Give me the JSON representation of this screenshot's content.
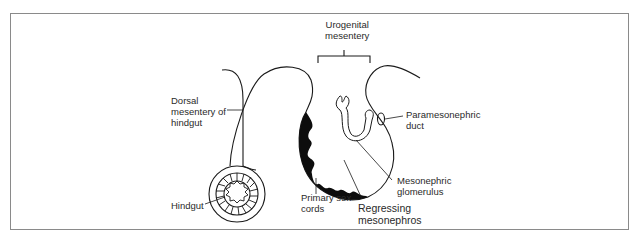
{
  "figure": {
    "labels": {
      "urogenital_mesentery": "Urogenital\nmesentery",
      "dorsal_mesentery": "Dorsal\nmesentery of\nhindgut",
      "hindgut": "Hindgut",
      "paramesonephric_duct": "Paramesonephric\nduct",
      "mesonephric_glomerulus": "Mesonephric\nglomerulus",
      "primary_sex_cords": "Primary sex\ncords",
      "regressing_mesonephros": "Regressing\nmesonephros"
    },
    "colors": {
      "line": "#1a1a1a",
      "fill_dark": "#0d0d0d",
      "frame": "#8a8a8a",
      "text": "#2a2a2a",
      "background": "#ffffff"
    }
  }
}
